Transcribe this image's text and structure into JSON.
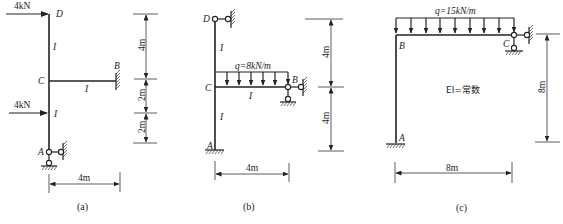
{
  "figures": [
    {
      "caption": "(a)",
      "nodes": {
        "D": "D",
        "C": "C",
        "B": "B",
        "A": "A"
      },
      "members": [
        {
          "id": "DC",
          "stiffness": "I"
        },
        {
          "id": "CB",
          "stiffness": "I"
        },
        {
          "id": "CA",
          "stiffness": "I"
        }
      ],
      "loads": [
        {
          "type": "point",
          "at": "D",
          "label": "4kN",
          "direction": "right"
        },
        {
          "type": "point",
          "at": "mid-CA",
          "label": "4kN",
          "direction": "right"
        }
      ],
      "supports": {
        "A": "pin (two-link)",
        "B": "fixed"
      },
      "dimensions": {
        "vertical": [
          "4m",
          "2m",
          "2m"
        ],
        "horizontal": "4m"
      }
    },
    {
      "caption": "(b)",
      "nodes": {
        "D": "D",
        "C": "C",
        "B": "B",
        "A": "A"
      },
      "members": [
        {
          "id": "DC",
          "stiffness": "I"
        },
        {
          "id": "CB",
          "stiffness": "I"
        },
        {
          "id": "CA",
          "stiffness": "I"
        }
      ],
      "loads": [
        {
          "type": "distributed",
          "on": "CB",
          "label": "q=8kN/m",
          "direction": "down"
        }
      ],
      "supports": {
        "D": "roller (horizontal link)",
        "B": "pin (two-link)",
        "A": "fixed"
      },
      "dimensions": {
        "vertical": [
          "4m",
          "4m"
        ],
        "horizontal": "4m"
      }
    },
    {
      "caption": "(c)",
      "nodes": {
        "B": "B",
        "C": "C",
        "A": "A"
      },
      "members": [
        {
          "id": "AB"
        },
        {
          "id": "BC"
        }
      ],
      "loads": [
        {
          "type": "distributed",
          "on": "BC",
          "label": "q=15kN/m",
          "direction": "down"
        }
      ],
      "note": "EI=常数",
      "supports": {
        "A": "fixed",
        "C": "pin (two-link)"
      },
      "dimensions": {
        "vertical": [
          "8m"
        ],
        "horizontal": "8m"
      }
    }
  ]
}
